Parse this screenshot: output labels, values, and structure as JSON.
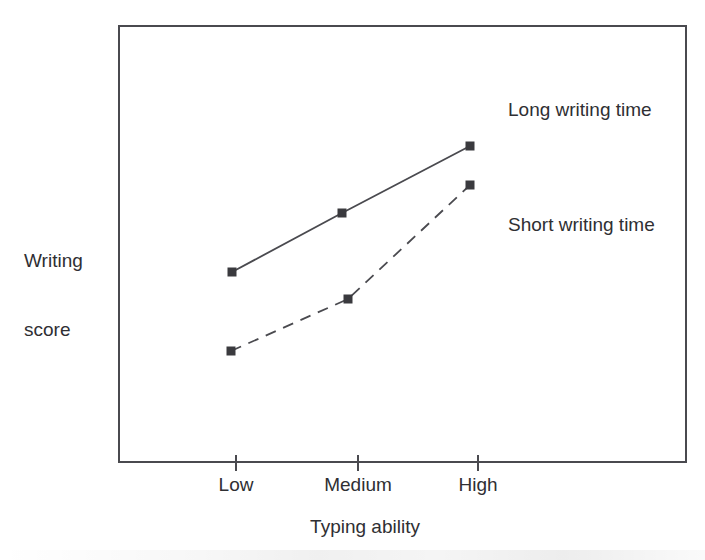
{
  "chart_data": {
    "type": "line",
    "title": "",
    "subtitle": "",
    "xlabel": "Typing ability",
    "ylabel": "Writing\nscore",
    "ylabel_lines": [
      "Writing",
      "score"
    ],
    "categories": [
      "Low",
      "Medium",
      "High"
    ],
    "grid": false,
    "legend_position": "inside-right",
    "annotations": [
      "Long writing time",
      "Short writing time"
    ],
    "axis_ranges": {
      "x_tick_pixels": [
        236,
        358,
        478
      ],
      "y_axis_labeled": false
    },
    "series": [
      {
        "name": "Long writing time",
        "line_style": "solid",
        "marker": "filled-square",
        "color": "#3a3a3e",
        "values": [
          42,
          58,
          76
        ],
        "points_px": [
          [
            232,
            272
          ],
          [
            342,
            213
          ],
          [
            470,
            146
          ]
        ]
      },
      {
        "name": "Short writing time",
        "line_style": "dashed",
        "marker": "filled-square",
        "color": "#3a3a3e",
        "values": [
          20,
          34,
          64
        ],
        "points_px": [
          [
            231,
            351
          ],
          [
            348,
            299
          ],
          [
            470,
            185
          ]
        ]
      }
    ]
  },
  "axes": {
    "y_title_line1": "Writing",
    "y_title_line2": "score",
    "x_title": "Typing ability",
    "tick_labels": [
      "Low",
      "Medium",
      "High"
    ]
  },
  "legend": {
    "long_label": "Long writing time",
    "short_label": "Short writing time"
  },
  "colors": {
    "frame": "#4a4a4f",
    "series": "#3a3a3e",
    "text": "#2f2f33",
    "background": "#ffffff"
  }
}
